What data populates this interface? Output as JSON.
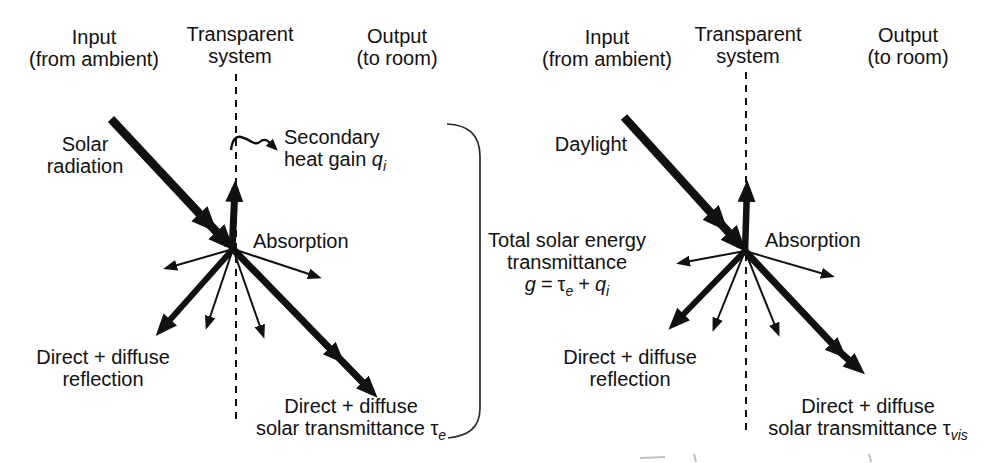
{
  "figure": {
    "background_color": "#ffffff",
    "ink_color": "#111111",
    "type": "solar-and-daylight-transmittance-diagram"
  },
  "left_panel": {
    "header": {
      "input_line1": "Input",
      "input_line2": "(from ambient)",
      "system_line1": "Transparent",
      "system_line2": "system",
      "output_line1": "Output",
      "output_line2": "(to room)"
    },
    "source_line1": "Solar",
    "source_line2": "radiation",
    "secondary_line1": "Secondary",
    "secondary_line2_text": "heat gain ",
    "secondary_symbol": "q",
    "secondary_symbol_sub": "i",
    "absorption_label": "Absorption",
    "reflection_line1": "Direct + diffuse",
    "reflection_line2": "reflection",
    "transmittance_line1": "Direct + diffuse",
    "transmittance_line2_text": "solar transmittance ",
    "transmittance_symbol": "τ",
    "transmittance_symbol_sub": "e"
  },
  "total_note": {
    "line1": "Total solar energy",
    "line2": "transmittance",
    "formula_g": "g",
    "formula_equals": "=",
    "formula_tau": "τ",
    "formula_tau_sub": "e",
    "formula_plus": "+",
    "formula_q": "q",
    "formula_q_sub": "i"
  },
  "right_panel": {
    "header": {
      "input_line1": "Input",
      "input_line2": "(from ambient)",
      "system_line1": "Transparent",
      "system_line2": "system",
      "output_line1": "Output",
      "output_line2": "(to room)"
    },
    "source_label": "Daylight",
    "absorption_label": "Absorption",
    "reflection_line1": "Direct + diffuse",
    "reflection_line2": "reflection",
    "transmittance_line1": "Direct + diffuse",
    "transmittance_line2_text": "solar transmittance ",
    "transmittance_symbol": "τ",
    "transmittance_symbol_sub": "vis"
  }
}
